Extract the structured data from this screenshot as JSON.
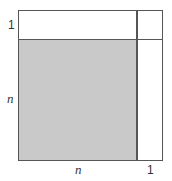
{
  "diagram": {
    "labels": {
      "left_top": "1",
      "left_middle": "n",
      "bottom_left": "n",
      "bottom_right": "1"
    },
    "colors": {
      "shaded": "#c9c9c9",
      "lines": "#555555",
      "background": "#ffffff"
    }
  }
}
